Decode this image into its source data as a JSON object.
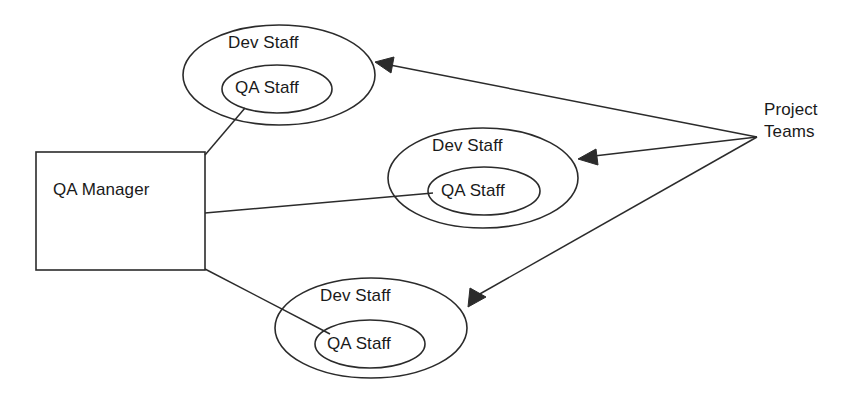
{
  "diagram": {
    "colors": {
      "stroke": "#2b2b2b",
      "text": "#1a1a1a",
      "background": "#ffffff"
    },
    "box": {
      "label": "QA Manager",
      "x": 36,
      "y": 152,
      "width": 169,
      "height": 118
    },
    "teams": [
      {
        "outer_label": "Dev Staff",
        "inner_label": "QA Staff",
        "outer": {
          "cx": 279,
          "cy": 75,
          "rx": 96,
          "ry": 50
        },
        "inner": {
          "cx": 277,
          "cy": 89,
          "rx": 55,
          "ry": 24
        }
      },
      {
        "outer_label": "Dev Staff",
        "inner_label": "QA Staff",
        "outer": {
          "cx": 483,
          "cy": 178,
          "rx": 95,
          "ry": 50
        },
        "inner": {
          "cx": 484,
          "cy": 191,
          "rx": 56,
          "ry": 24
        }
      },
      {
        "outer_label": "Dev Staff",
        "inner_label": "QA Staff",
        "outer": {
          "cx": 371,
          "cy": 328,
          "rx": 96,
          "ry": 50
        },
        "inner": {
          "cx": 370,
          "cy": 344,
          "rx": 55,
          "ry": 24
        }
      }
    ],
    "annotation": {
      "label": "Project Teams",
      "line1": "Project",
      "line2": "Teams",
      "x": 764,
      "y": 98,
      "origin": {
        "x": 757,
        "y": 137
      }
    },
    "arrows": [
      {
        "from": {
          "x": 757,
          "y": 137
        },
        "to": {
          "x": 375,
          "y": 62
        }
      },
      {
        "from": {
          "x": 757,
          "y": 137
        },
        "to": {
          "x": 578,
          "y": 159
        }
      },
      {
        "from": {
          "x": 757,
          "y": 137
        },
        "to": {
          "x": 468,
          "y": 307
        }
      }
    ],
    "connectors": [
      {
        "from": {
          "x": 205,
          "y": 155
        },
        "to": {
          "x": 245,
          "y": 108
        }
      },
      {
        "from": {
          "x": 205,
          "y": 213
        },
        "to": {
          "x": 433,
          "y": 193
        }
      },
      {
        "from": {
          "x": 205,
          "y": 269
        },
        "to": {
          "x": 330,
          "y": 334
        }
      }
    ]
  }
}
